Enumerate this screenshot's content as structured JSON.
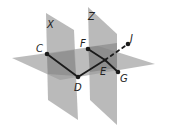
{
  "diagram": {
    "type": "three-planes-with-polyline",
    "planes": [
      {
        "name": "X",
        "orientation": "vertical"
      },
      {
        "name": "Z",
        "orientation": "vertical"
      },
      {
        "name": "",
        "orientation": "horizontal"
      }
    ],
    "points": [
      {
        "name": "C"
      },
      {
        "name": "D"
      },
      {
        "name": "F"
      },
      {
        "name": "E"
      },
      {
        "name": "G"
      },
      {
        "name": "J"
      }
    ],
    "segments": [
      "C-D",
      "D-E",
      "F-E",
      "E-G",
      "E-J (dashed, behind plane)"
    ],
    "colors": {
      "plane": "#9a9a9a",
      "plane_overlap": "#6e6e6e",
      "line": "#1a1a1a"
    }
  }
}
